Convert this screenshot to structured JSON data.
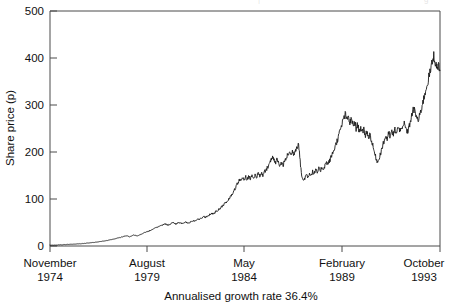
{
  "figure": {
    "top_clipped_text_1": "|",
    "top_clipped_text_2": "g",
    "caption": "Annualised growth rate 36.4%"
  },
  "axes": {
    "y_title": "Share price (p)",
    "y_ticks": [
      "0",
      "100",
      "200",
      "300",
      "400",
      "500"
    ],
    "x_ticks": [
      {
        "month": "November",
        "year": "1974"
      },
      {
        "month": "August",
        "year": "1979"
      },
      {
        "month": "May",
        "year": "1984"
      },
      {
        "month": "February",
        "year": "1989"
      },
      {
        "month": "October",
        "year": "1993"
      }
    ]
  },
  "chart_data": {
    "type": "line",
    "title": "",
    "xlabel": "",
    "ylabel": "Share price (p)",
    "annotation": "Annualised growth rate 36.4%",
    "xlim": [
      0,
      228
    ],
    "ylim": [
      0,
      500
    ],
    "grid": false,
    "legend": "none",
    "line_color": "#1a1a1a",
    "x_tick_positions": [
      0,
      57,
      114,
      171,
      228
    ],
    "x_tick_labels": [
      "November 1974",
      "August 1979",
      "May 1984",
      "February 1989",
      "October 1993"
    ],
    "y_ticks": [
      0,
      100,
      200,
      300,
      400,
      500
    ],
    "x_unit": "months since November 1974",
    "series": [
      {
        "name": "Share price",
        "values": [
          1.5,
          1.6,
          1.8,
          1.9,
          2.1,
          2.2,
          2.4,
          2.5,
          2.7,
          2.9,
          3.1,
          3.2,
          3.4,
          3.6,
          3.7,
          3.9,
          4.2,
          4.4,
          4.6,
          4.8,
          5.1,
          5.3,
          5.6,
          5.9,
          6.2,
          6.5,
          6.8,
          7.2,
          7.6,
          8.0,
          8.4,
          8.8,
          9.3,
          9.8,
          10.3,
          10.8,
          11.4,
          12.0,
          12.6,
          13.3,
          14.0,
          14.8,
          15.5,
          16.4,
          17.2,
          18.1,
          19.0,
          20.0,
          21.0,
          22.1,
          21.0,
          19.5,
          20.5,
          22.0,
          23.5,
          22.5,
          21.0,
          22.5,
          24.0,
          25.5,
          27.0,
          28.5,
          30.0,
          31.0,
          32.5,
          34.0,
          35.5,
          37.0,
          38.5,
          40.0,
          41.5,
          43.0,
          44.0,
          45.5,
          47.0,
          46.0,
          44.5,
          46.5,
          48.0,
          49.5,
          48.0,
          46.5,
          48.5,
          50.0,
          49.0,
          47.5,
          49.5,
          51.0,
          50.0,
          48.5,
          50.5,
          52.5,
          54.0,
          53.0,
          55.0,
          57.0,
          56.0,
          58.0,
          60.0,
          62.0,
          61.0,
          63.0,
          65.0,
          67.0,
          69.0,
          68.0,
          71.0,
          74.0,
          76.0,
          79.0,
          82.0,
          85.0,
          88.0,
          92.0,
          96.0,
          100.0,
          105.0,
          110.0,
          116.0,
          122.0,
          128.0,
          135.0,
          142.0,
          138.0,
          145.0,
          139.0,
          147.0,
          141.0,
          149.0,
          143.0,
          151.0,
          145.0,
          152.0,
          147.0,
          153.0,
          149.0,
          155.0,
          151.0,
          157.0,
          162.0,
          168.0,
          175.0,
          182.0,
          188.0,
          183.0,
          176.0,
          184.0,
          178.0,
          170.0,
          177.0,
          172.0,
          180.0,
          186.0,
          194.0,
          200.0,
          193.0,
          201.0,
          196.0,
          205.0,
          212.0,
          219.0,
          180.0,
          150.0,
          138.0,
          145.0,
          152.0,
          147.0,
          155.0,
          150.0,
          158.0,
          153.0,
          161.0,
          156.0,
          164.0,
          160.0,
          168.0,
          164.0,
          172.0,
          178.0,
          174.0,
          182.0,
          190.0,
          198.0,
          207.0,
          216.0,
          226.0,
          237.0,
          248.0,
          260.0,
          272.0,
          280.0,
          268.0,
          275.0,
          262.0,
          270.0,
          256.0,
          264.0,
          250.0,
          258.0,
          245.0,
          252.0,
          240.0,
          248.0,
          236.0,
          244.0,
          230.0,
          238.0,
          222.0,
          210.0,
          196.0,
          185.0,
          178.0,
          190.0,
          200.0,
          212.0,
          222.0,
          234.0,
          228.0,
          240.0,
          232.0,
          244.0,
          236.0,
          248.0,
          240.0,
          252.0,
          244.0,
          256.0,
          248.0,
          260.0,
          250.0,
          242.0,
          252.0,
          266.0,
          280.0,
          292.0,
          284.0,
          274.0,
          266.0,
          278.0,
          292.0,
          306.0,
          320.0,
          334.0,
          348.0,
          362.0,
          375.0,
          390.0,
          405.0,
          392.0,
          378.0,
          386.0,
          374.0
        ]
      }
    ]
  }
}
